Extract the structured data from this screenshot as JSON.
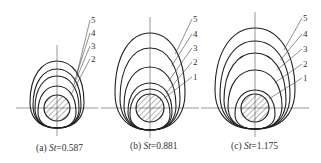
{
  "figure": {
    "stroke_color": "#222222",
    "background": "#ffffff",
    "panels": [
      {
        "id": "a",
        "caption_prefix": "(a) ",
        "caption_var": "St",
        "caption_value": "=0.587",
        "center": [
          57,
          108
        ],
        "shaft_radius": 13,
        "bottom_y": 128,
        "curves": [
          {
            "label": "2",
            "top": 86,
            "halfwidth": 19
          },
          {
            "label": "3",
            "top": 76,
            "halfwidth": 22
          },
          {
            "label": "4",
            "top": 69,
            "halfwidth": 24
          },
          {
            "label": "5",
            "top": 61,
            "halfwidth": 27
          }
        ],
        "labels": [
          {
            "text": "5",
            "x": 91,
            "y": 23
          },
          {
            "text": "4",
            "x": 91,
            "y": 36
          },
          {
            "text": "3",
            "x": 91,
            "y": 49
          },
          {
            "text": "2",
            "x": 91,
            "y": 62
          }
        ]
      },
      {
        "id": "b",
        "caption_prefix": "(b) ",
        "caption_var": "St",
        "caption_value": "=0.881",
        "center": [
          150,
          108
        ],
        "shaft_radius": 14,
        "bottom_y": 130,
        "curves": [
          {
            "label": "1",
            "top": 89,
            "halfwidth": 20
          },
          {
            "label": "2",
            "top": 83,
            "halfwidth": 22
          },
          {
            "label": "3",
            "top": 67,
            "halfwidth": 26
          },
          {
            "label": "4",
            "top": 48,
            "halfwidth": 30
          },
          {
            "label": "5",
            "top": 33,
            "halfwidth": 35
          }
        ],
        "labels": [
          {
            "text": "5",
            "x": 193,
            "y": 22
          },
          {
            "text": "4",
            "x": 193,
            "y": 37
          },
          {
            "text": "3",
            "x": 193,
            "y": 51
          },
          {
            "text": "2",
            "x": 193,
            "y": 65
          },
          {
            "text": "1",
            "x": 193,
            "y": 80
          }
        ]
      },
      {
        "id": "c",
        "caption_prefix": "(c) ",
        "caption_var": "St",
        "caption_value": "=1.175",
        "center": [
          255,
          108
        ],
        "shaft_radius": 14,
        "bottom_y": 129,
        "curves": [
          {
            "label": "1",
            "top": 90,
            "halfwidth": 20
          },
          {
            "label": "2",
            "top": 70,
            "halfwidth": 27
          },
          {
            "label": "3",
            "top": 53,
            "halfwidth": 31
          },
          {
            "label": "4",
            "top": 41,
            "halfwidth": 35
          },
          {
            "label": "5",
            "top": 28,
            "halfwidth": 40
          }
        ],
        "labels": [
          {
            "text": "5",
            "x": 303,
            "y": 21
          },
          {
            "text": "4",
            "x": 303,
            "y": 37
          },
          {
            "text": "3",
            "x": 303,
            "y": 52
          },
          {
            "text": "2",
            "x": 303,
            "y": 67
          },
          {
            "text": "1",
            "x": 303,
            "y": 81
          }
        ]
      }
    ]
  }
}
